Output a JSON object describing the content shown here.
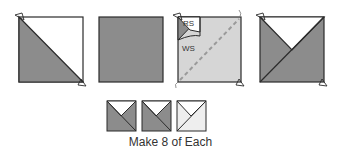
{
  "colors": {
    "dark_fabric": "#8c8c8c",
    "light_fabric": "#d6d6d6",
    "white_fabric": "#ffffff",
    "outline": "#2b2b2b",
    "seam_line": "#9a9a9a",
    "lightest_fabric": "#eeeeee"
  },
  "labels": {
    "right_side": "RS",
    "wrong_side": "WS"
  },
  "steps": [
    {
      "name": "half-square-triangle",
      "description": "diagonal split white/dark"
    },
    {
      "name": "dark-square",
      "description": "solid dark square"
    },
    {
      "name": "light-square-with-stitch-line",
      "description": "light square, dashed diagonal, HST placed RS facing"
    },
    {
      "name": "quarter-square-result",
      "description": "dark/white hourglass split"
    }
  ],
  "results": [
    {
      "name": "unit-dark-a"
    },
    {
      "name": "unit-dark-b"
    },
    {
      "name": "unit-light"
    }
  ],
  "caption": "Make 8 of Each"
}
